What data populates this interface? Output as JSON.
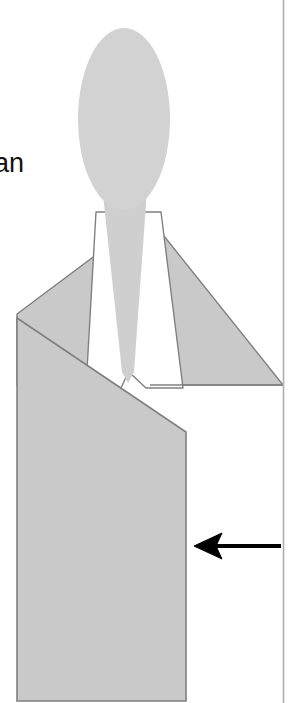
{
  "figure": {
    "canvas": {
      "width": 290,
      "height": 703,
      "background_color": "#ffffff"
    },
    "labels": {
      "partial_text": "an",
      "partial_text_color": "#111111"
    },
    "colors": {
      "fill_gray": "#c9c9c9",
      "head_gray": "#d2d2d2",
      "outline_gray": "#808080",
      "border_gray": "#b0b0b0",
      "arrow_black": "#000000",
      "shirt_white": "#ffffff"
    },
    "parts": {
      "head": "head-ellipse",
      "neck": "neck-shape",
      "left_lapel": "left-lapel",
      "right_lapel": "right-lapel",
      "shirt_left": "shirt-panel-left",
      "shirt_right": "shirt-panel-right",
      "shoulders": "shoulder-triangle",
      "torso": "jacket-torso",
      "arrow": "annotation-arrow",
      "right_border": "right-border-line"
    },
    "annotation_arrow": {
      "direction": "left",
      "tip_x": 195,
      "tail_x": 281,
      "y": 546
    }
  }
}
